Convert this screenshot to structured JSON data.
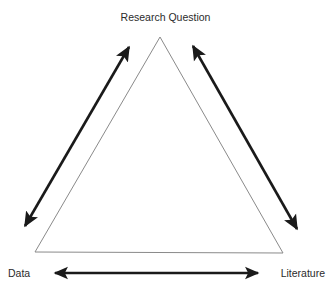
{
  "diagram": {
    "type": "triangle-relationship-diagram",
    "background_color": "#ffffff",
    "vertices": {
      "apex": {
        "label": "Research Question",
        "name": "research-question",
        "x": 160,
        "y": 37
      },
      "bottom_left": {
        "label": "Data",
        "name": "data",
        "x": 35,
        "y": 252
      },
      "bottom_right": {
        "label": "Literature",
        "name": "literature",
        "x": 283,
        "y": 253
      }
    },
    "triangle": {
      "outline_color": "#8a8a8a",
      "fill": "none",
      "stroke_width": 1,
      "points": "160,37 35,252 283,253"
    },
    "arrows": {
      "color": "#1a1a1a",
      "stroke_width": 2.6,
      "items": [
        {
          "name": "data-to-research-question-arrow",
          "double_headed": true,
          "from_x": 25,
          "from_y": 226,
          "to_x": 129,
          "to_y": 47
        },
        {
          "name": "literature-to-research-question-arrow",
          "double_headed": true,
          "from_x": 297,
          "from_y": 229,
          "to_x": 193,
          "to_y": 46
        },
        {
          "name": "data-to-literature-arrow",
          "double_headed": true,
          "from_x": 55,
          "from_y": 273,
          "to_x": 258,
          "to_y": 273
        }
      ]
    }
  }
}
